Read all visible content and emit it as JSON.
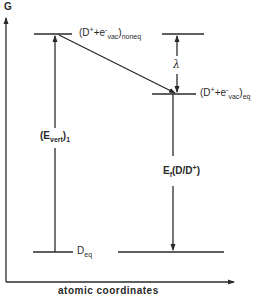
{
  "diagram": {
    "type": "energy-level diagram",
    "axes": {
      "y_label": "G",
      "x_label": "atomic coordinates"
    },
    "levels": {
      "noneq": {
        "main": "(D",
        "sup1": "+",
        "mid": "+e",
        "sup2": "-",
        "sub1": "vac",
        "close": ")",
        "sub2": "noneq"
      },
      "eq": {
        "main": "(D",
        "sup1": "+",
        "mid": "+e",
        "sup2": "-",
        "sub1": "vac",
        "close": ")",
        "sub2": "eq"
      },
      "ground": {
        "main": "D",
        "sub": "eq"
      }
    },
    "annotations": {
      "evert": {
        "open": "(E",
        "sub1": "vert",
        "close": ")",
        "sub2": "1"
      },
      "lambda": "λ",
      "ef": {
        "main": "E",
        "sub": "f",
        "rest": "(D/D",
        "sup": "+",
        "close": ")"
      }
    },
    "colors": {
      "ink": "#2a2a2a",
      "background": "#ffffff"
    }
  }
}
